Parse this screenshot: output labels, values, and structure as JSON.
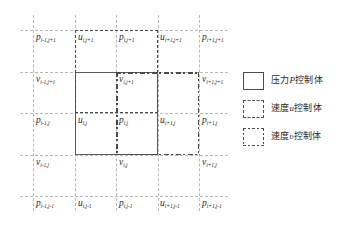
{
  "diagram": {
    "type": "staggered-grid-control-volume",
    "grid": {
      "vertical_lines_x": [
        33,
        75,
        116,
        158,
        199
      ],
      "horizontal_lines_y": [
        30,
        72,
        113,
        155,
        196
      ],
      "line_style": "dashed",
      "line_color": "#b9b9b9"
    },
    "control_volumes": [
      {
        "id": "p-cv",
        "style": "solid",
        "x": 75,
        "y": 72,
        "w": 83,
        "h": 83,
        "color": "#5a5a5a"
      },
      {
        "id": "u-cv",
        "style": "dashed",
        "x": 75,
        "y": 30,
        "w": 83,
        "h": 83,
        "color": "#4a4a4a"
      },
      {
        "id": "v-cv",
        "style": "dashdot",
        "x": 116,
        "y": 72,
        "w": 83,
        "h": 83,
        "color": "#4a4a4a"
      }
    ],
    "nodes": [
      {
        "id": "p-im1-jp1",
        "sym": "p",
        "sub": "i-1,j+1",
        "x": 36,
        "y": 33
      },
      {
        "id": "u-i-jp1",
        "sym": "u",
        "sub": "i,j+1",
        "x": 78,
        "y": 33
      },
      {
        "id": "p-i-jp1",
        "sym": "p",
        "sub": "i,j+1",
        "x": 119,
        "y": 33
      },
      {
        "id": "u-ip1-jp1",
        "sym": "u",
        "sub": "i+1,j+1",
        "x": 160,
        "y": 33
      },
      {
        "id": "p-ip1-jp1",
        "sym": "p",
        "sub": "i+1,j+1",
        "x": 202,
        "y": 33
      },
      {
        "id": "v-im1-jp1",
        "sym": "v",
        "sub": "i-1,j+1",
        "x": 36,
        "y": 75
      },
      {
        "id": "v-i-jp1",
        "sym": "v",
        "sub": "i,j+1",
        "x": 119,
        "y": 75
      },
      {
        "id": "v-ip1-jp1",
        "sym": "v",
        "sub": "i+1,j+1",
        "x": 202,
        "y": 75
      },
      {
        "id": "p-im1-j",
        "sym": "p",
        "sub": "i-1,j",
        "x": 36,
        "y": 116
      },
      {
        "id": "u-i-j",
        "sym": "u",
        "sub": "i,j",
        "x": 78,
        "y": 116
      },
      {
        "id": "p-i-j",
        "sym": "p",
        "sub": "i,j",
        "x": 119,
        "y": 116
      },
      {
        "id": "u-ip1-j",
        "sym": "u",
        "sub": "i+1,j",
        "x": 160,
        "y": 116
      },
      {
        "id": "p-ip1-j",
        "sym": "p",
        "sub": "i+1,j",
        "x": 202,
        "y": 116
      },
      {
        "id": "v-im1-j",
        "sym": "v",
        "sub": "i-1,j",
        "x": 36,
        "y": 158
      },
      {
        "id": "v-i-j",
        "sym": "v",
        "sub": "i,j",
        "x": 119,
        "y": 158
      },
      {
        "id": "v-ip1-j",
        "sym": "v",
        "sub": "i+1,j",
        "x": 202,
        "y": 158
      },
      {
        "id": "p-im1-jm1",
        "sym": "p",
        "sub": "i-1,j-1",
        "x": 36,
        "y": 199
      },
      {
        "id": "u-i-jm1",
        "sym": "u",
        "sub": "i,j-1",
        "x": 78,
        "y": 199
      },
      {
        "id": "p-i-jm1",
        "sym": "p",
        "sub": "i,j-1",
        "x": 119,
        "y": 199
      },
      {
        "id": "u-ip1-jm1",
        "sym": "u",
        "sub": "i+1,j-1",
        "x": 160,
        "y": 199
      },
      {
        "id": "p-ip1-jm1",
        "sym": "p",
        "sub": "i+1,j-1",
        "x": 202,
        "y": 199
      }
    ]
  },
  "legend": {
    "items": [
      {
        "id": "legend-pressure",
        "swatch": "solid",
        "prefix": "压力",
        "symbol": "P",
        "suffix": "控制体"
      },
      {
        "id": "legend-velocity-u",
        "swatch": "dashed",
        "prefix": "速度",
        "symbol": "u",
        "suffix": "控制体"
      },
      {
        "id": "legend-velocity-v",
        "swatch": "dashdot",
        "prefix": "速度",
        "symbol": "υ",
        "suffix": "控制体"
      }
    ]
  }
}
